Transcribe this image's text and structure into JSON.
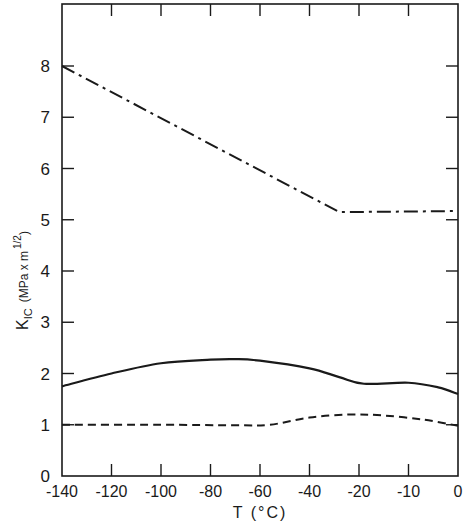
{
  "chart_data": {
    "type": "line",
    "title": "",
    "xlabel": "T (°C)",
    "ylabel": "K_IC (MPa x m^1/2)",
    "ylabel_parts": {
      "main": "K",
      "sub": "IC",
      "units_prefix": "(MPa x m",
      "units_sup": "1/2",
      "units_suffix": ")"
    },
    "x_ticks": [
      "-140",
      "-120",
      "-100",
      "-80",
      "-60",
      "-40",
      "-20",
      "-10",
      "0"
    ],
    "x_scale_note": "ticks evenly spaced; last interval -20 to -10 to 0 shares equal spacing",
    "y_ticks": [
      "0",
      "1",
      "2",
      "3",
      "4",
      "5",
      "6",
      "7",
      "8"
    ],
    "ylim": [
      0,
      9
    ],
    "grid": false,
    "legend": "none",
    "series": [
      {
        "name": "dash-dot curve",
        "style": "dash-dot",
        "points": [
          {
            "x_index": 0,
            "x": -140,
            "y": 8.0
          },
          {
            "x_index": 5.6,
            "x": -28,
            "y": 5.15
          },
          {
            "x_index": 7.0,
            "x": -10,
            "y": 5.16
          },
          {
            "x_index": 7.9,
            "x": -1,
            "y": 5.17
          }
        ]
      },
      {
        "name": "solid curve",
        "style": "solid",
        "points": [
          {
            "x_index": 0,
            "x": -140,
            "y": 1.75
          },
          {
            "x_index": 1,
            "x": -120,
            "y": 2.0
          },
          {
            "x_index": 2,
            "x": -100,
            "y": 2.2
          },
          {
            "x_index": 3,
            "x": -80,
            "y": 2.27
          },
          {
            "x_index": 3.5,
            "x": -70,
            "y": 2.28
          },
          {
            "x_index": 4,
            "x": -60,
            "y": 2.25
          },
          {
            "x_index": 5,
            "x": -40,
            "y": 2.1
          },
          {
            "x_index": 5.6,
            "x": -28,
            "y": 1.93
          },
          {
            "x_index": 6.1,
            "x": -19,
            "y": 1.8
          },
          {
            "x_index": 7.0,
            "x": -10,
            "y": 1.82
          },
          {
            "x_index": 7.6,
            "x": -4,
            "y": 1.73
          },
          {
            "x_index": 8,
            "x": 0,
            "y": 1.6
          }
        ]
      },
      {
        "name": "dashed curve",
        "style": "dashed",
        "points": [
          {
            "x_index": 0,
            "x": -140,
            "y": 1.0
          },
          {
            "x_index": 2,
            "x": -100,
            "y": 1.0
          },
          {
            "x_index": 3.5,
            "x": -70,
            "y": 0.99
          },
          {
            "x_index": 4.2,
            "x": -56,
            "y": 1.0
          },
          {
            "x_index": 5,
            "x": -40,
            "y": 1.14
          },
          {
            "x_index": 5.8,
            "x": -24,
            "y": 1.2
          },
          {
            "x_index": 6.5,
            "x": -15,
            "y": 1.18
          },
          {
            "x_index": 7.3,
            "x": -7,
            "y": 1.1
          },
          {
            "x_index": 8,
            "x": 0,
            "y": 0.98
          }
        ]
      }
    ]
  }
}
